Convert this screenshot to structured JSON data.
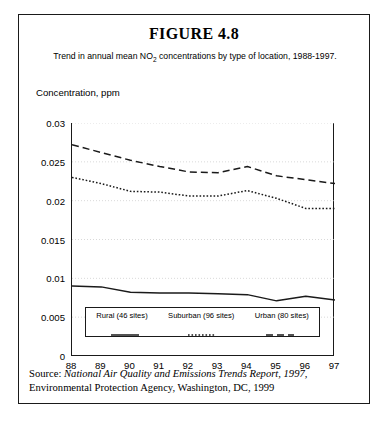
{
  "figure": {
    "title": "FIGURE 4.8",
    "subtitle_pre": "Trend in annual mean NO",
    "subtitle_sub": "2",
    "subtitle_post": " concentrations by type of location, 1988-1997.",
    "y_axis_title": "Concentration, ppm",
    "source_label": "Source: ",
    "source_title_italic": "National Air Quality and Emissions Trends Report, 1997,",
    "source_rest": "Environmental Protection Agency, Washington, DC, 1999"
  },
  "chart_data": {
    "type": "line",
    "title": "FIGURE 4.8",
    "subtitle": "Trend in annual mean NO2 concentrations by type of location, 1988-1997.",
    "xlabel": "",
    "ylabel": "Concentration, ppm",
    "x": [
      "88",
      "89",
      "90",
      "91",
      "92",
      "93",
      "94",
      "95",
      "96",
      "97"
    ],
    "x_full_years": [
      1988,
      1989,
      1990,
      1991,
      1992,
      1993,
      1994,
      1995,
      1996,
      1997
    ],
    "ylim": [
      0,
      0.03
    ],
    "yticks": [
      "0",
      "0.005",
      "0.01",
      "0.015",
      "0.02",
      "0.025",
      "0.03"
    ],
    "ytick_values": [
      0,
      0.005,
      0.01,
      0.015,
      0.02,
      0.025,
      0.03
    ],
    "grid": true,
    "grid_axis": "y",
    "legend_position": "inside-bottom-center",
    "series": [
      {
        "name": "Rural (46 sites)",
        "style": "solid",
        "color": "#1a1a1a",
        "values": [
          0.009,
          0.0089,
          0.0082,
          0.0081,
          0.0081,
          0.008,
          0.0079,
          0.0071,
          0.0077,
          0.0072
        ]
      },
      {
        "name": "Suburban (96 sites)",
        "style": "dotted",
        "color": "#1a1a1a",
        "values": [
          0.023,
          0.0222,
          0.0212,
          0.0211,
          0.0206,
          0.0206,
          0.0213,
          0.0203,
          0.019,
          0.019
        ]
      },
      {
        "name": "Urban (80 sites)",
        "style": "dashed",
        "color": "#1a1a1a",
        "values": [
          0.0272,
          0.0262,
          0.0252,
          0.0244,
          0.0237,
          0.0236,
          0.0244,
          0.0232,
          0.0227,
          0.0222
        ]
      }
    ]
  }
}
